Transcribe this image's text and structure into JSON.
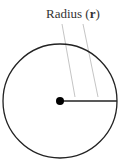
{
  "diagram": {
    "label_prefix": "Radius (",
    "label_var": "r",
    "label_suffix": ")",
    "circle": {
      "cx": 60,
      "cy": 101,
      "r": 57,
      "stroke": "#222222"
    },
    "center_dot": {
      "r": 4,
      "fill": "#000000"
    },
    "radius_line": {
      "x1": 60,
      "y1": 101,
      "x2": 117,
      "y2": 101,
      "stroke": "#222222"
    },
    "leader_color": "#aaaaaa"
  }
}
